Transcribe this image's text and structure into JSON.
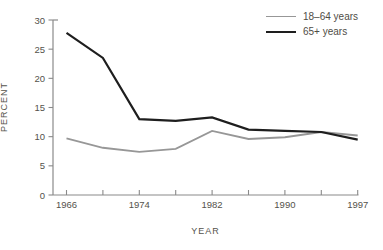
{
  "chart_data": {
    "type": "line",
    "title": "",
    "xlabel": "YEAR",
    "ylabel": "PERCENT",
    "x": [
      1966,
      1970,
      1974,
      1978,
      1982,
      1986,
      1990,
      1994,
      1997
    ],
    "x_tick_labels": [
      "1966",
      "",
      "1974",
      "",
      "1982",
      "",
      "1990",
      "",
      "1997"
    ],
    "y_ticks": [
      0,
      5,
      10,
      15,
      20,
      25,
      30
    ],
    "ylim": [
      0,
      30
    ],
    "grid": false,
    "legend_position": "top-right",
    "series": [
      {
        "name": "18–64 years",
        "color": "#979797",
        "width": 1.8,
        "values": [
          9.7,
          8.1,
          7.4,
          7.9,
          11.0,
          9.6,
          9.9,
          10.8,
          10.2
        ]
      },
      {
        "name": "65+ years",
        "color": "#1e1e1e",
        "width": 2.2,
        "values": [
          27.8,
          23.5,
          13.0,
          12.7,
          13.3,
          11.2,
          11.0,
          10.8,
          9.5
        ]
      }
    ]
  },
  "colors": {
    "axis": "#8a8a8a",
    "tick_text": "#54524b",
    "background": "#ffffff"
  }
}
